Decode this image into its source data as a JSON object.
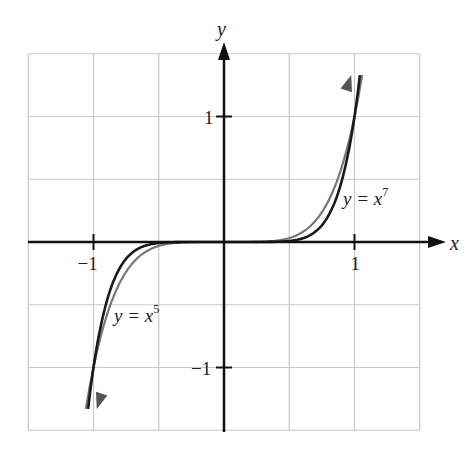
{
  "chart_data": {
    "type": "line",
    "title": "",
    "xlabel": "x",
    "ylabel": "y",
    "xlim": [
      -1.5,
      1.5
    ],
    "ylim": [
      -1.5,
      1.5
    ],
    "grid": true,
    "grid_step": 0.5,
    "x_ticks": [
      {
        "value": -1,
        "label": "−1"
      },
      {
        "value": 1,
        "label": "1"
      }
    ],
    "y_ticks": [
      {
        "value": 1,
        "label": "1"
      },
      {
        "value": -1,
        "label": "−1"
      }
    ],
    "series": [
      {
        "name": "y = x^5",
        "label_text": "y = x",
        "label_exp": "5",
        "color": "#777777",
        "exponent": 5,
        "x": [
          -1.05,
          -1,
          -0.75,
          -0.5,
          -0.25,
          0,
          0.25,
          0.5,
          0.75,
          1,
          1.05
        ],
        "y": [
          -1.276,
          -1,
          -0.237,
          -0.031,
          -0.001,
          0,
          0.001,
          0.031,
          0.237,
          1,
          1.276
        ]
      },
      {
        "name": "y = x^7",
        "label_text": "y = x",
        "label_exp": "7",
        "color": "#1a1a1a",
        "exponent": 7,
        "x": [
          -1.04,
          -1,
          -0.75,
          -0.5,
          -0.25,
          0,
          0.25,
          0.5,
          0.75,
          1,
          1.04
        ],
        "y": [
          -1.316,
          -1,
          -0.133,
          -0.008,
          0,
          0,
          0,
          0.008,
          0.133,
          1,
          1.316
        ]
      }
    ],
    "annotations": [
      {
        "text": "y = x^7",
        "near": [
          1.0,
          0.35
        ]
      },
      {
        "text": "y = x^5",
        "near": [
          -0.8,
          -0.45
        ]
      }
    ]
  }
}
